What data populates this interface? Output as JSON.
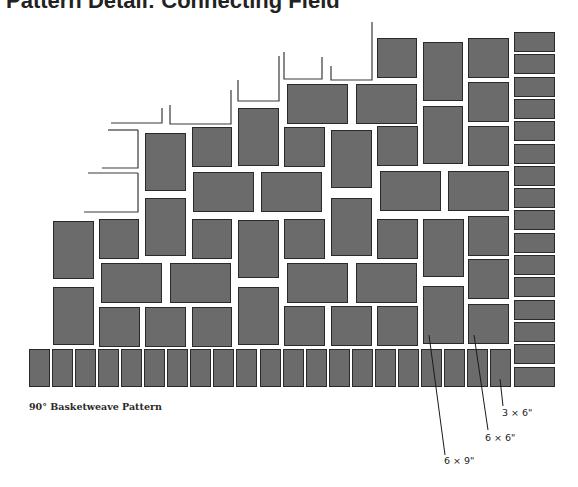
{
  "header": {
    "title": "Pattern Detail: Connecting Field"
  },
  "diagram": {
    "caption": "90° Basketweave Pattern",
    "tile_color": "#6b6b6b",
    "tile_border_color": "#2a2a2a",
    "callouts": [
      {
        "label": "3 × 6\"",
        "x": 502,
        "y": 405
      },
      {
        "label": "6 × 6\"",
        "x": 485,
        "y": 430
      },
      {
        "label": "6 × 9\"",
        "x": 444,
        "y": 453
      }
    ],
    "tiles": [
      {
        "x": 377,
        "y": 38,
        "w": 40,
        "h": 40
      },
      {
        "x": 423,
        "y": 42,
        "w": 40,
        "h": 59
      },
      {
        "x": 468,
        "y": 38,
        "w": 41,
        "h": 40
      },
      {
        "x": 468,
        "y": 82,
        "w": 41,
        "h": 40
      },
      {
        "x": 423,
        "y": 106,
        "w": 40,
        "h": 58
      },
      {
        "x": 468,
        "y": 126,
        "w": 41,
        "h": 40
      },
      {
        "x": 287,
        "y": 84,
        "w": 61,
        "h": 40
      },
      {
        "x": 356,
        "y": 84,
        "w": 61,
        "h": 40
      },
      {
        "x": 238,
        "y": 108,
        "w": 41,
        "h": 58
      },
      {
        "x": 284,
        "y": 127,
        "w": 41,
        "h": 40
      },
      {
        "x": 331,
        "y": 130,
        "w": 41,
        "h": 58
      },
      {
        "x": 377,
        "y": 126,
        "w": 41,
        "h": 40
      },
      {
        "x": 192,
        "y": 127,
        "w": 40,
        "h": 40
      },
      {
        "x": 145,
        "y": 133,
        "w": 41,
        "h": 58
      },
      {
        "x": 193,
        "y": 172,
        "w": 61,
        "h": 40
      },
      {
        "x": 261,
        "y": 172,
        "w": 61,
        "h": 40
      },
      {
        "x": 380,
        "y": 171,
        "w": 61,
        "h": 40
      },
      {
        "x": 448,
        "y": 171,
        "w": 61,
        "h": 40
      },
      {
        "x": 145,
        "y": 198,
        "w": 41,
        "h": 58
      },
      {
        "x": 331,
        "y": 198,
        "w": 41,
        "h": 58
      },
      {
        "x": 53,
        "y": 221,
        "w": 41,
        "h": 58
      },
      {
        "x": 99,
        "y": 219,
        "w": 40,
        "h": 40
      },
      {
        "x": 192,
        "y": 219,
        "w": 40,
        "h": 40
      },
      {
        "x": 238,
        "y": 220,
        "w": 41,
        "h": 58
      },
      {
        "x": 284,
        "y": 219,
        "w": 41,
        "h": 40
      },
      {
        "x": 377,
        "y": 219,
        "w": 41,
        "h": 40
      },
      {
        "x": 423,
        "y": 219,
        "w": 41,
        "h": 58
      },
      {
        "x": 468,
        "y": 216,
        "w": 41,
        "h": 40
      },
      {
        "x": 101,
        "y": 263,
        "w": 61,
        "h": 40
      },
      {
        "x": 170,
        "y": 263,
        "w": 61,
        "h": 40
      },
      {
        "x": 287,
        "y": 263,
        "w": 61,
        "h": 40
      },
      {
        "x": 356,
        "y": 263,
        "w": 61,
        "h": 40
      },
      {
        "x": 468,
        "y": 259,
        "w": 41,
        "h": 40
      },
      {
        "x": 53,
        "y": 287,
        "w": 41,
        "h": 58
      },
      {
        "x": 238,
        "y": 287,
        "w": 41,
        "h": 58
      },
      {
        "x": 423,
        "y": 286,
        "w": 41,
        "h": 58
      },
      {
        "x": 99,
        "y": 307,
        "w": 41,
        "h": 40
      },
      {
        "x": 145,
        "y": 307,
        "w": 41,
        "h": 40
      },
      {
        "x": 192,
        "y": 307,
        "w": 40,
        "h": 40
      },
      {
        "x": 284,
        "y": 306,
        "w": 41,
        "h": 40
      },
      {
        "x": 331,
        "y": 306,
        "w": 41,
        "h": 40
      },
      {
        "x": 377,
        "y": 306,
        "w": 41,
        "h": 40
      },
      {
        "x": 468,
        "y": 304,
        "w": 41,
        "h": 40
      }
    ],
    "bottom_row": {
      "x0": 29,
      "y": 349,
      "w": 21,
      "h": 38,
      "pitch": 23.05,
      "count": 21
    },
    "right_column": {
      "x": 514,
      "y0": 32,
      "w": 41,
      "h": 20,
      "pitch": 22.3,
      "count": 16
    }
  }
}
